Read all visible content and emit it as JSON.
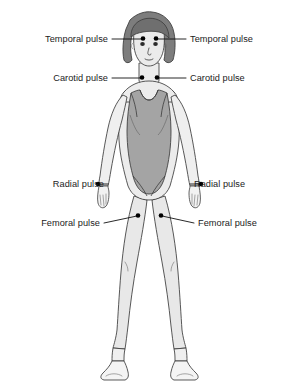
{
  "diagram": {
    "background_color": "#ffffff",
    "colors": {
      "skin": "#efefef",
      "skin_shadow": "#e2e2e2",
      "swimsuit": "#a4a4a4",
      "swimsuit_shadow": "#9a9a9a",
      "hair": "#7d7d7d",
      "hair_shadow": "#6f6f6f",
      "outline": "#3b3b3b",
      "leader_line": "#111111",
      "marker_dot": "#000000",
      "label_text": "#1b1b1b"
    },
    "labels": [
      {
        "id": "temporal-left",
        "text": "Temporal pulse",
        "side": "left",
        "text_x": 108,
        "text_y": 42,
        "leader": "M112,39 L142,39",
        "dot_x": 143,
        "dot_y": 38.5
      },
      {
        "id": "temporal-right",
        "text": "Temporal pulse",
        "side": "right",
        "text_x": 190,
        "text_y": 42,
        "leader": "M186,39 L157,39",
        "dot_x": 156,
        "dot_y": 38.5
      },
      {
        "id": "carotid-left",
        "text": "Carotid pulse",
        "side": "left",
        "text_x": 108,
        "text_y": 81,
        "leader": "M112,78 L141,78",
        "dot_x": 142,
        "dot_y": 77.5
      },
      {
        "id": "carotid-right",
        "text": "Carotid pulse",
        "side": "right",
        "text_x": 190,
        "text_y": 81,
        "leader": "M186,78 L158,78",
        "dot_x": 157,
        "dot_y": 77.5
      },
      {
        "id": "radial-left",
        "text": "Radial pulse",
        "side": "left",
        "text_x": 104,
        "text_y": 187,
        "leader": "M108,184 L99,184",
        "dot_x": 98,
        "dot_y": 184
      },
      {
        "id": "radial-right",
        "text": "Radial pulse",
        "side": "right",
        "text_x": 194,
        "text_y": 187,
        "leader": "M190,184 L200,184",
        "dot_x": 201,
        "dot_y": 184
      },
      {
        "id": "femoral-left",
        "text": "Femoral pulse",
        "side": "left",
        "text_x": 100,
        "text_y": 226,
        "leader": "M104,223 L137,216",
        "dot_x": 138,
        "dot_y": 215.5
      },
      {
        "id": "femoral-right",
        "text": "Femoral pulse",
        "side": "right",
        "text_x": 198,
        "text_y": 226,
        "leader": "M194,223 L162,216",
        "dot_x": 161,
        "dot_y": 215.5
      }
    ],
    "pulse_points": [
      {
        "name": "Temporal pulse",
        "count": 2,
        "location": "temples, beside the forehead"
      },
      {
        "name": "Carotid pulse",
        "count": 2,
        "location": "either side of the base of the neck"
      },
      {
        "name": "Radial pulse",
        "count": 2,
        "location": "wrists, thumb side"
      },
      {
        "name": "Femoral pulse",
        "count": 2,
        "location": "upper inner thighs / groin"
      }
    ]
  }
}
